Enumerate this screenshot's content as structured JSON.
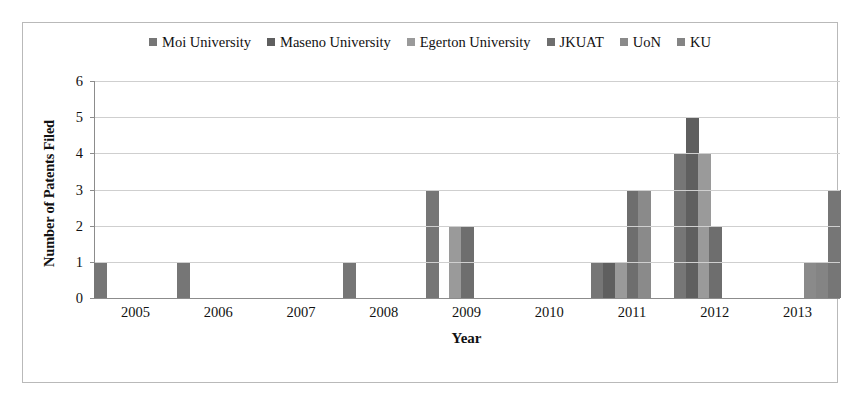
{
  "chart_data": {
    "type": "bar",
    "title": "",
    "xlabel": "Year",
    "ylabel": "Number of Patents Filed",
    "categories": [
      "2005",
      "2006",
      "2007",
      "2008",
      "2009",
      "2010",
      "2011",
      "2012",
      "2013"
    ],
    "ylim": [
      0,
      6
    ],
    "yticks": [
      0,
      1,
      2,
      3,
      4,
      5,
      6
    ],
    "grid": true,
    "legend_position": "top-center",
    "series": [
      {
        "name": "Moi University",
        "color": "#767676",
        "values": [
          1,
          1,
          0,
          1,
          3,
          0,
          1,
          4,
          0
        ]
      },
      {
        "name": "Maseno University",
        "color": "#5f5f5f",
        "values": [
          0,
          0,
          0,
          0,
          0,
          0,
          1,
          5,
          0
        ]
      },
      {
        "name": "Egerton University",
        "color": "#9a9a9a",
        "values": [
          0,
          0,
          0,
          0,
          2,
          0,
          1,
          4,
          0
        ]
      },
      {
        "name": "JKUAT",
        "color": "#6e6e6e",
        "values": [
          0,
          0,
          0,
          0,
          2,
          0,
          3,
          2,
          0
        ]
      },
      {
        "name": "UoN",
        "color": "#8a8a8a",
        "values": [
          0,
          0,
          0,
          0,
          0,
          0,
          3,
          0,
          1
        ]
      },
      {
        "name": "KU",
        "color": "#848484",
        "values": [
          0,
          0,
          0,
          0,
          0,
          0,
          0,
          0,
          1
        ]
      }
    ],
    "extra_bars": [
      {
        "category": "2013",
        "series": "Moi University",
        "value": 3,
        "slot": 6
      }
    ]
  }
}
